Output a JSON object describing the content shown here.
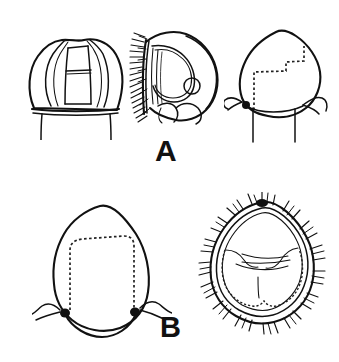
{
  "plate": {
    "title": "Line-drawing figure plate",
    "background_color": "#ffffff",
    "ink_color": "#111111",
    "width": 339,
    "height": 362,
    "panels": [
      {
        "id": "A",
        "label": "A",
        "label_position": {
          "x": 155,
          "y": 136
        },
        "figures": [
          {
            "name": "figure-a1-dorsal-shield",
            "description": "dorsal view of sclerotized plate with paired lateral lobes and inner rectangular frame, two ventral stalks",
            "position": {
              "x": 22,
              "y": 28,
              "width": 108,
              "height": 104
            },
            "view": "dorsal"
          },
          {
            "name": "figure-a2-lateral-spined",
            "description": "lateral view with dense comb of marginal setae along left margin, inner lobed outline and small circular pore",
            "position": {
              "x": 132,
              "y": 28,
              "width": 88,
              "height": 102
            },
            "view": "lateral"
          },
          {
            "name": "figure-a3-ventral-dashed",
            "description": "ventral view, rounded pentagonal outline, internal stepped dashed margin, paired lateral appendages and stalks",
            "position": {
              "x": 228,
              "y": 28,
              "width": 108,
              "height": 110
            },
            "view": "ventral"
          }
        ]
      },
      {
        "id": "B",
        "label": "B",
        "label_position": {
          "x": 160,
          "y": 313
        },
        "figures": [
          {
            "name": "figure-b1-capsule-dashed",
            "description": "rounded capsule outline with internal dashed subrectangular margin and paired lateral bent appendages",
            "position": {
              "x": 38,
              "y": 198,
              "width": 128,
              "height": 135
            },
            "view": "dorsal"
          },
          {
            "name": "figure-b2-setose-capsule",
            "description": "pentagonal capsule ringed by radiating marginal setae, inner dashed margin and internal transverse folds with median line",
            "position": {
              "x": 200,
              "y": 196,
              "width": 122,
              "height": 134
            },
            "view": "dorsal"
          }
        ]
      }
    ]
  }
}
